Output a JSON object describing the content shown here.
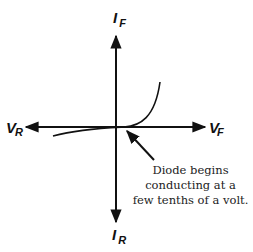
{
  "diagram": {
    "axes": {
      "y_positive": {
        "main": "I",
        "sub": "F"
      },
      "y_negative": {
        "main": "I",
        "sub": "R"
      },
      "x_positive": {
        "main": "V",
        "sub": "F"
      },
      "x_negative": {
        "main": "V",
        "sub": "R"
      }
    },
    "annotation": {
      "lines": [
        "Diode begins",
        "conducting at a",
        "few tenths of a volt."
      ]
    },
    "colors": {
      "stroke": "#111111",
      "background": "#ffffff"
    }
  }
}
